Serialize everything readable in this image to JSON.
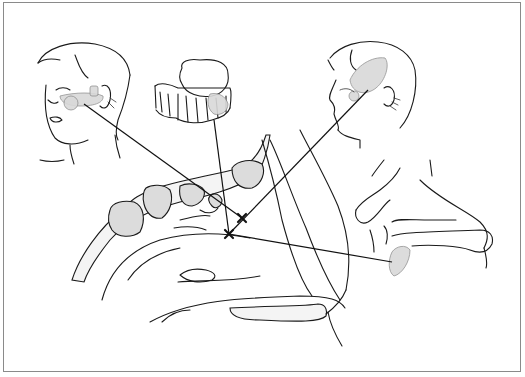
{
  "figure": {
    "type": "anatomical-line-illustration",
    "panels": [
      {
        "id": "front-face",
        "description": "Frontal face with shaded pain area over cheek and zygomatic region"
      },
      {
        "id": "maxillary-teeth",
        "description": "Upper molars/maxilla with shaded region"
      },
      {
        "id": "side-head",
        "description": "Profile head with shaded temporal region"
      },
      {
        "id": "sagittal-section",
        "description": "Sagittal section of nasal cavity with sinuses"
      },
      {
        "id": "nasopharynx-detail",
        "description": "Nasopharynx / soft palate with shaded area"
      }
    ],
    "markers": [
      {
        "symbol": "×",
        "x": 242,
        "y": 218
      },
      {
        "symbol": "×",
        "x": 229,
        "y": 234
      }
    ],
    "colors": {
      "line": "#1a1a1a",
      "shade": "#d9d9d9",
      "border": "#8a8a8a",
      "background": "#ffffff"
    }
  }
}
